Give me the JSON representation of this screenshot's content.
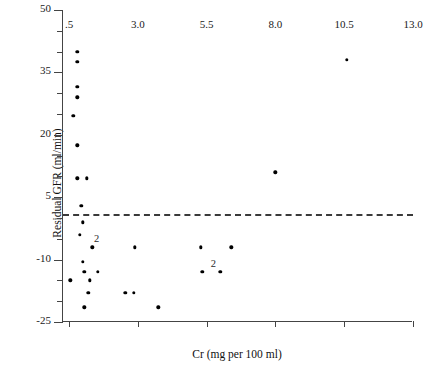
{
  "chart_data": {
    "type": "scatter",
    "title": "",
    "xlabel": "Cr (mg per 100 ml)",
    "ylabel": "Residual GFR (ml/min)",
    "xlim": [
      0.5,
      13.0
    ],
    "ylim": [
      -25,
      50
    ],
    "xticks": [
      0.5,
      3.0,
      5.5,
      8.0,
      10.5,
      13.0
    ],
    "xtick_labels": [
      ".5",
      "3.0",
      "5.5",
      "8.0",
      "10.5",
      "13.0"
    ],
    "yticks": [
      -25,
      -20,
      -15,
      -10,
      -5,
      0,
      5,
      10,
      15,
      20,
      25,
      30,
      35,
      40,
      45,
      50
    ],
    "ytick_labels_major": {
      "50": "50",
      "35": "35",
      "20": "20",
      "5": "5",
      "-10": "-10",
      "-25": "-25"
    },
    "ymajor": [
      50,
      35,
      20,
      5,
      -10,
      -25
    ],
    "grid": false,
    "legend": null,
    "reference_line": {
      "y": 1.0,
      "style": "dashed",
      "color": "#3a3a3a"
    },
    "marker": {
      "shape": "circle",
      "color": "#000000",
      "size": 3.4
    },
    "points": [
      {
        "x": 0.8,
        "y": 40.0,
        "n": 1
      },
      {
        "x": 0.8,
        "y": 37.5,
        "n": 1
      },
      {
        "x": 0.8,
        "y": 31.5,
        "n": 1
      },
      {
        "x": 0.8,
        "y": 29.0,
        "n": 1
      },
      {
        "x": 0.65,
        "y": 24.5,
        "n": 1
      },
      {
        "x": 0.8,
        "y": 17.5,
        "n": 1
      },
      {
        "x": 0.8,
        "y": 9.5,
        "n": 1
      },
      {
        "x": 1.15,
        "y": 9.5,
        "n": 1
      },
      {
        "x": 0.95,
        "y": 3.0,
        "n": 1
      },
      {
        "x": 1.0,
        "y": -1.0,
        "n": 1
      },
      {
        "x": 0.9,
        "y": -4.0,
        "n": 1
      },
      {
        "x": 1.35,
        "y": -7.0,
        "n": 2
      },
      {
        "x": 2.9,
        "y": -7.0,
        "n": 1
      },
      {
        "x": 5.3,
        "y": -7.0,
        "n": 1
      },
      {
        "x": 6.4,
        "y": -7.0,
        "n": 1
      },
      {
        "x": 1.0,
        "y": -10.5,
        "n": 1
      },
      {
        "x": 1.05,
        "y": -13.0,
        "n": 1
      },
      {
        "x": 1.55,
        "y": -13.0,
        "n": 1
      },
      {
        "x": 5.35,
        "y": -13.0,
        "n": 1
      },
      {
        "x": 6.0,
        "y": -13.0,
        "n": 2
      },
      {
        "x": 0.55,
        "y": -15.0,
        "n": 1
      },
      {
        "x": 1.25,
        "y": -15.0,
        "n": 1
      },
      {
        "x": 1.2,
        "y": -18.0,
        "n": 1
      },
      {
        "x": 2.55,
        "y": -18.0,
        "n": 1
      },
      {
        "x": 2.85,
        "y": -18.0,
        "n": 1
      },
      {
        "x": 1.05,
        "y": -21.5,
        "n": 1
      },
      {
        "x": 3.75,
        "y": -21.5,
        "n": 1
      },
      {
        "x": 8.0,
        "y": 11.0,
        "n": 1
      },
      {
        "x": 10.6,
        "y": 38.0,
        "n": 1
      }
    ],
    "overlap_labels": [
      {
        "x": 1.5,
        "y": -5.0,
        "text": "2"
      },
      {
        "x": 5.75,
        "y": -11.0,
        "text": "2"
      }
    ]
  }
}
